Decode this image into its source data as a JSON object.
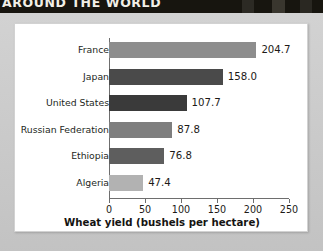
{
  "header": {
    "banner_text": "AROUND THE WORLD"
  },
  "chart_data": {
    "type": "bar",
    "orientation": "horizontal",
    "title": "",
    "xlabel": "Wheat yield (bushels per hectare)",
    "ylabel": "",
    "xlim": [
      0,
      250
    ],
    "xticks": [
      0,
      50,
      100,
      150,
      200,
      250
    ],
    "xtick_labels": [
      "0",
      "50",
      "100",
      "150",
      "200",
      "250"
    ],
    "grid": false,
    "legend": "none",
    "categories": [
      "France",
      "Japan",
      "United States",
      "Russian Federation",
      "Ethiopia",
      "Algeria"
    ],
    "values": [
      204.7,
      158.0,
      107.7,
      87.8,
      76.8,
      47.4
    ],
    "value_labels": [
      "204.7",
      "158.0",
      "107.7",
      "87.8",
      "76.8",
      "47.4"
    ],
    "bar_colors": [
      "#8d8d8d",
      "#4a4a4a",
      "#3a3a3a",
      "#7e7e7e",
      "#5e5e5e",
      "#b2b2b2"
    ]
  },
  "colors": {
    "panel_background": "#ffffff",
    "page_background": "#cdcdcd",
    "header_band": "#17150f",
    "axis": "#6e6e6e",
    "text": "#1d1a17"
  }
}
